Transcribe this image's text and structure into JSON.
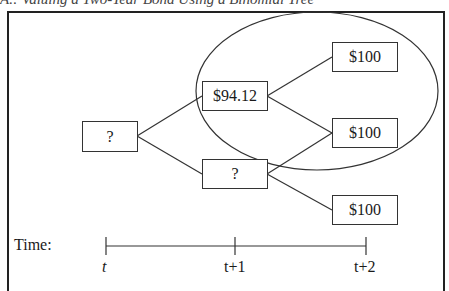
{
  "caption": "A.: Valuing a Two-Year Bond Using a Binomial Tree",
  "nodes": {
    "root": "?",
    "up_t1": "$94.12",
    "down_t1": "?",
    "uu_t2": "$100",
    "ud_t2": "$100",
    "dd_t2": "$100"
  },
  "timeline": {
    "label": "Time:",
    "ticks": [
      "t",
      "t+1",
      "t+2"
    ]
  }
}
